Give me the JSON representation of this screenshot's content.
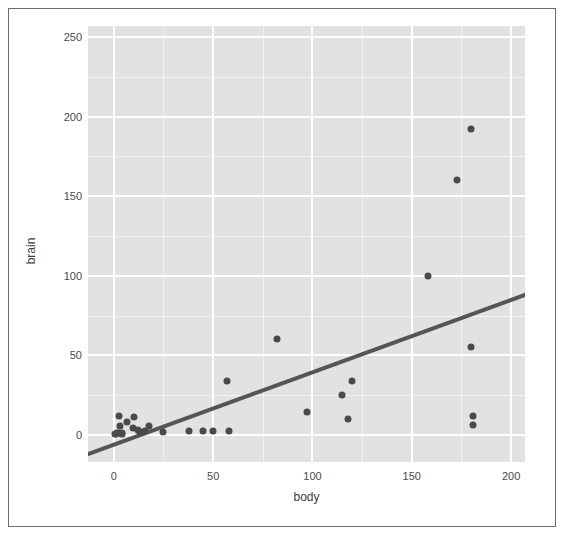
{
  "chart_data": {
    "type": "scatter",
    "title": "",
    "xlabel": "body",
    "ylabel": "brain",
    "xlim": [
      -13,
      207
    ],
    "ylim": [
      -17,
      257
    ],
    "xticks": [
      0,
      50,
      100,
      150,
      200
    ],
    "yticks": [
      0,
      50,
      100,
      150,
      200,
      250
    ],
    "xtick_labels": [
      "0",
      "50",
      "100",
      "150",
      "200"
    ],
    "ytick_labels": [
      "0",
      "50",
      "100",
      "150",
      "200",
      "250"
    ],
    "grid": true,
    "grid_color": "#ffffff",
    "panel_color": "#e2e2e2",
    "point_color": "#4a4a4a",
    "line_color": "#555555",
    "legend": "none",
    "points": [
      {
        "x": 0.4,
        "y": 0.4
      },
      {
        "x": 1.0,
        "y": 0.8
      },
      {
        "x": 1.4,
        "y": 1.2
      },
      {
        "x": 2.0,
        "y": 1.5
      },
      {
        "x": 2.5,
        "y": 12.1
      },
      {
        "x": 3.3,
        "y": 5.5
      },
      {
        "x": 4.0,
        "y": 1.0
      },
      {
        "x": 4.2,
        "y": 0.9
      },
      {
        "x": 6.8,
        "y": 8.0
      },
      {
        "x": 9.6,
        "y": 4.4
      },
      {
        "x": 10.0,
        "y": 11.5
      },
      {
        "x": 12.0,
        "y": 3.0
      },
      {
        "x": 13.0,
        "y": 2.0
      },
      {
        "x": 15.5,
        "y": 2.5
      },
      {
        "x": 17.5,
        "y": 5.5
      },
      {
        "x": 25.0,
        "y": 2.0
      },
      {
        "x": 38.0,
        "y": 2.5
      },
      {
        "x": 45.0,
        "y": 2.5
      },
      {
        "x": 50.0,
        "y": 2.5
      },
      {
        "x": 57.0,
        "y": 34.0
      },
      {
        "x": 58.0,
        "y": 2.5
      },
      {
        "x": 82.0,
        "y": 60.0
      },
      {
        "x": 97.0,
        "y": 14.5
      },
      {
        "x": 115.0,
        "y": 25.0
      },
      {
        "x": 118.0,
        "y": 10.0
      },
      {
        "x": 120.0,
        "y": 34.0
      },
      {
        "x": 158.0,
        "y": 100.0
      },
      {
        "x": 173.0,
        "y": 160.0
      },
      {
        "x": 180.0,
        "y": 192.0
      },
      {
        "x": 180.0,
        "y": 55.0
      },
      {
        "x": 181.0,
        "y": 12.0
      },
      {
        "x": 181.0,
        "y": 6.0
      }
    ],
    "fit_line": {
      "type": "linear",
      "x_start": -13,
      "y_start": -12,
      "x_end": 207,
      "y_end": 88,
      "slope": 0.4545,
      "intercept": -6.09
    }
  },
  "figure": {
    "y_axis_title": "brain",
    "x_axis_title": "body"
  }
}
